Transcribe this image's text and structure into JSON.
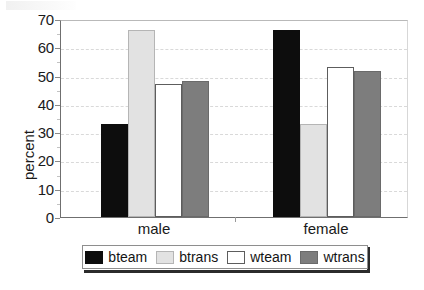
{
  "chart_data": {
    "type": "bar",
    "title": "",
    "subtitle": "",
    "xlabel": "",
    "ylabel": "percent",
    "categories": [
      "male",
      "female"
    ],
    "series": [
      {
        "name": "bteam",
        "values": [
          33,
          66
        ],
        "color": "#0d0d0d"
      },
      {
        "name": "btrans",
        "values": [
          66,
          33
        ],
        "color": "#e2e2e2"
      },
      {
        "name": "wteam",
        "values": [
          47,
          53
        ],
        "color": "#ffffff"
      },
      {
        "name": "wtrans",
        "values": [
          48,
          51.5
        ],
        "color": "#7d7d7d"
      }
    ],
    "ylim": [
      0,
      70
    ],
    "ytick_labels": [
      "70",
      "60",
      "50",
      "40",
      "30",
      "20",
      "10",
      "0"
    ],
    "ytick_values": [
      70,
      60,
      50,
      40,
      30,
      20,
      10,
      0
    ],
    "grid": "horizontal-dashed",
    "legend_position": "bottom",
    "legend_entries": [
      "bteam",
      "btrans",
      "wteam",
      "wtrans"
    ]
  },
  "axes": {
    "y_title": "percent",
    "x_categories": [
      "male",
      "female"
    ]
  },
  "legend": {
    "entries": [
      {
        "label": "bteam"
      },
      {
        "label": "btrans"
      },
      {
        "label": "wteam"
      },
      {
        "label": "wtrans"
      }
    ]
  },
  "caption": {
    "text": ""
  },
  "colors": {
    "bteam": "#0d0d0d",
    "btrans": "#e2e2e2",
    "wteam": "#ffffff",
    "wtrans": "#7d7d7d",
    "axis": "#6f6f6f",
    "grid": "#d9d9d9",
    "text": "#1a1a1a"
  }
}
